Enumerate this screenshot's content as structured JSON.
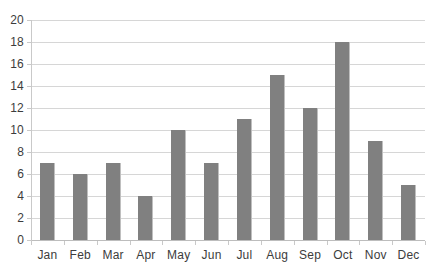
{
  "chart_data": {
    "type": "bar",
    "title": "",
    "subtitle": "",
    "xlabel": "",
    "ylabel": "",
    "categories": [
      "Jan",
      "Feb",
      "Mar",
      "Apr",
      "May",
      "Jun",
      "Jul",
      "Aug",
      "Sep",
      "Oct",
      "Nov",
      "Dec"
    ],
    "values": [
      7,
      6,
      7,
      4,
      10,
      7,
      11,
      15,
      12,
      18,
      9,
      5
    ],
    "series": [
      {
        "name": "",
        "values": [
          7,
          6,
          7,
          4,
          10,
          7,
          11,
          15,
          12,
          18,
          9,
          5
        ]
      }
    ],
    "ylim": [
      0,
      20
    ],
    "y_ticks": [
      0,
      2,
      4,
      6,
      8,
      10,
      12,
      14,
      16,
      18,
      20
    ],
    "y_tick_labels": [
      "0",
      "2",
      "4",
      "6",
      "8",
      "10",
      "12",
      "14",
      "16",
      "18",
      "20"
    ],
    "grid": true,
    "grid_axis": "y",
    "legend": false,
    "legend_position": "none",
    "annotations": [],
    "colors": {
      "bar": "#808080",
      "bar_edge": "#bfbfbf",
      "gridline": "#d6d6d6",
      "axis_line": "#c9c9c9",
      "baseline": "#bdbdbd",
      "tick_label": "#3c3c3c",
      "background": "#ffffff"
    }
  }
}
